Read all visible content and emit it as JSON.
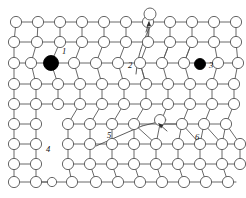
{
  "figure": {
    "background_color": "#ffffff",
    "atom_fill": "#ffffff",
    "atom_stroke": "#555555",
    "dark_atom_fill": "#000000",
    "bond_color": "#585858",
    "label_color": "#111111",
    "width": 246,
    "height": 198
  },
  "labels": [
    {
      "id": "label-1",
      "text": "1",
      "x": 64,
      "y": 52,
      "meaning": "substitutional-impurity-atom"
    },
    {
      "id": "label-2",
      "text": "2",
      "x": 130,
      "y": 66,
      "meaning": "edge-dislocation"
    },
    {
      "id": "label-3",
      "text": "3",
      "x": 209,
      "y": 66,
      "meaning": "interstitial-impurity-atom"
    },
    {
      "id": "label-4",
      "text": "4",
      "x": 48,
      "y": 150,
      "meaning": "vacancy-region"
    },
    {
      "id": "label-5",
      "text": "5",
      "x": 109,
      "y": 136,
      "meaning": "dislocation-line"
    },
    {
      "id": "label-6",
      "text": "6",
      "x": 197,
      "y": 138,
      "meaning": "grain-boundary-distortion"
    }
  ],
  "dark_atoms": [
    {
      "id": "dark-atom-1",
      "cx": 51,
      "cy": 63,
      "r": 7.5,
      "label": "1"
    },
    {
      "id": "dark-atom-3",
      "cx": 200,
      "cy": 64,
      "r": 5.5,
      "label": "3"
    }
  ],
  "adatom": {
    "id": "adatom-top",
    "cx": 150,
    "cy": 14,
    "r": 6.0
  },
  "free_atom_mid": {
    "id": "free-atom-middle",
    "cx": 160,
    "cy": 120,
    "r": 5.5
  },
  "annotation_arrows": [
    {
      "id": "arrow-adatom",
      "x1": 146,
      "y1": 30,
      "x2": 149,
      "y2": 21
    },
    {
      "id": "arrow-interior",
      "x1": 164,
      "y1": 130,
      "x2": 158,
      "y2": 124
    }
  ],
  "dislocation_curves": [
    {
      "id": "curve-edge-dislocation",
      "path": "M 152 22 C 144 40, 138 52, 136 74"
    },
    {
      "id": "curve-slip-line",
      "path": "M 96 146 L 140 126"
    }
  ],
  "atom_radius_default": 5.6,
  "rows": [
    {
      "id": "row-0",
      "y": 22,
      "xs": [
        16,
        38,
        60,
        82,
        104,
        126,
        148,
        170,
        192,
        214,
        236
      ]
    },
    {
      "id": "row-1",
      "y": 42,
      "xs": [
        14,
        37,
        60,
        82,
        104,
        126,
        148,
        170,
        192,
        214,
        236
      ]
    },
    {
      "id": "row-2",
      "y": 63,
      "xs": [
        14,
        31,
        51,
        74,
        96,
        118,
        140,
        162,
        184,
        200,
        218,
        238
      ]
    },
    {
      "id": "row-3",
      "y": 84,
      "xs": [
        14,
        36,
        58,
        80,
        102,
        124,
        146,
        168,
        190,
        212,
        234
      ]
    },
    {
      "id": "row-4",
      "y": 104,
      "xs": [
        14,
        36,
        58,
        80,
        102,
        124,
        146,
        168,
        190,
        212,
        234
      ]
    },
    {
      "id": "row-5",
      "y": 124,
      "xs": [
        14,
        36,
        68,
        90,
        112,
        134,
        160,
        182,
        204,
        226
      ]
    },
    {
      "id": "row-6",
      "y": 144,
      "xs": [
        14,
        36,
        68,
        90,
        112,
        134,
        156,
        178,
        200,
        222,
        240
      ]
    },
    {
      "id": "row-7",
      "y": 164,
      "xs": [
        14,
        36,
        68,
        90,
        112,
        134,
        156,
        178,
        200,
        222,
        240
      ]
    },
    {
      "id": "row-8",
      "y": 182,
      "xs": [
        14,
        36,
        52,
        72,
        96,
        118,
        140,
        162,
        184,
        206,
        228
      ]
    }
  ]
}
